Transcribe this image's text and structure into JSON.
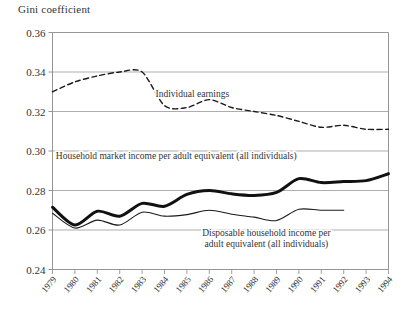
{
  "chart_data": {
    "type": "line",
    "title": "Gini coefficient",
    "xlabel": "",
    "ylabel": "Gini coefficient",
    "ylim": [
      0.24,
      0.36
    ],
    "xlim": [
      1979,
      1994
    ],
    "grid": true,
    "legend_position": "inline-annotations",
    "yticks": [
      "0.24",
      "0.26",
      "0.28",
      "0.30",
      "0.32",
      "0.34",
      "0.36"
    ],
    "ytick_values": [
      0.24,
      0.26,
      0.28,
      0.3,
      0.32,
      0.34,
      0.36
    ],
    "categories": [
      1979,
      1980,
      1981,
      1982,
      1983,
      1984,
      1985,
      1986,
      1987,
      1988,
      1989,
      1990,
      1991,
      1992,
      1993,
      1994
    ],
    "xticks": [
      "1979",
      "1980",
      "1981",
      "1982",
      "1983",
      "1984",
      "1985",
      "1986",
      "1987",
      "1988",
      "1989",
      "1990",
      "1991",
      "1992",
      "1993",
      "1994"
    ],
    "series": [
      {
        "name": "Individual earnings",
        "style": "dashed",
        "width": 1.4,
        "color": "#1a1a1a",
        "x": [
          1979,
          1980,
          1981,
          1982,
          1983,
          1984,
          1985,
          1986,
          1987,
          1988,
          1989,
          1990,
          1991,
          1992,
          1993,
          1994
        ],
        "values": [
          0.33,
          0.335,
          0.338,
          0.34,
          0.34,
          0.323,
          0.322,
          0.326,
          0.322,
          0.32,
          0.318,
          0.315,
          0.312,
          0.313,
          0.311,
          0.311
        ]
      },
      {
        "name": "Household market income per adult equivalent (all individuals)",
        "style": "solid-thick",
        "width": 3.0,
        "color": "#111111",
        "x": [
          1979,
          1980,
          1981,
          1982,
          1983,
          1984,
          1985,
          1986,
          1987,
          1988,
          1989,
          1990,
          1991,
          1992,
          1993,
          1994
        ],
        "values": [
          0.2715,
          0.2625,
          0.2695,
          0.267,
          0.2735,
          0.272,
          0.278,
          0.28,
          0.2783,
          0.2775,
          0.279,
          0.286,
          0.284,
          0.2845,
          0.285,
          0.2885
        ]
      },
      {
        "name": "Disposable household income per adult equivalent (all individuals)",
        "style": "solid-thin",
        "width": 1.1,
        "color": "#1a1a1a",
        "x": [
          1979,
          1980,
          1981,
          1982,
          1983,
          1984,
          1985,
          1986,
          1987,
          1988,
          1989,
          1990,
          1991,
          1992
        ],
        "values": [
          0.2685,
          0.261,
          0.265,
          0.2625,
          0.269,
          0.267,
          0.2678,
          0.27,
          0.268,
          0.2665,
          0.2648,
          0.2705,
          0.27,
          0.27
        ]
      }
    ],
    "annotations": [
      {
        "id": "individual-earnings",
        "text": "Individual earnings",
        "x": 1983.6,
        "y": 0.3275,
        "anchor": "start"
      },
      {
        "id": "household-market-income",
        "text": "Household market income per adult equivalent (all individuals)",
        "x": 1979.15,
        "y": 0.2962,
        "anchor": "start"
      },
      {
        "id": "disposable-household-income-line1",
        "text": "Disposable household income per",
        "x": 1988.55,
        "y": 0.2572,
        "anchor": "middle"
      },
      {
        "id": "disposable-household-income-line2",
        "text": "adult equivalent (all individuals)",
        "x": 1988.55,
        "y": 0.2512,
        "anchor": "middle"
      }
    ],
    "colors": {
      "axis": "#555555",
      "grid": "#8a8a8a",
      "text": "#333333",
      "background": "#ffffff"
    }
  }
}
